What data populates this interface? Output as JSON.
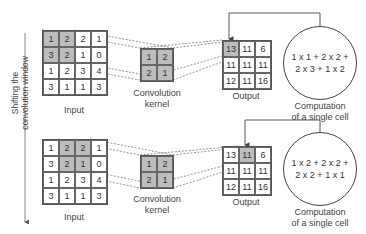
{
  "side_label": {
    "line1": "Shifting the",
    "line2": "convolution window"
  },
  "colors": {
    "shaded": "#bdbdbd",
    "line": "#444444",
    "dashed": "#666666"
  },
  "panels": [
    {
      "input": {
        "label": "Input",
        "cells": [
          [
            1,
            2,
            2,
            1
          ],
          [
            3,
            2,
            1,
            0
          ],
          [
            1,
            2,
            3,
            4
          ],
          [
            3,
            1,
            1,
            3
          ]
        ],
        "shaded": [
          [
            0,
            0
          ],
          [
            0,
            1
          ],
          [
            1,
            0
          ],
          [
            1,
            1
          ]
        ]
      },
      "kernel": {
        "label_line1": "Convolution",
        "label_line2": "kernel",
        "cells": [
          [
            1,
            2
          ],
          [
            2,
            1
          ]
        ]
      },
      "output": {
        "label": "Output",
        "cells": [
          [
            13,
            11,
            6
          ],
          [
            11,
            11,
            11
          ],
          [
            12,
            11,
            16
          ]
        ],
        "shaded": [
          [
            0,
            0
          ]
        ]
      },
      "computation": {
        "line1": "1 x 1 + 2 x 2 +",
        "line2": "2 x 3 + 1 x 2",
        "label_line1": "Computation",
        "label_line2": "of a single cell"
      }
    },
    {
      "input": {
        "label": "Input",
        "cells": [
          [
            1,
            2,
            2,
            1
          ],
          [
            3,
            2,
            1,
            0
          ],
          [
            1,
            2,
            3,
            4
          ],
          [
            3,
            1,
            1,
            3
          ]
        ],
        "shaded": [
          [
            0,
            1
          ],
          [
            0,
            2
          ],
          [
            1,
            1
          ],
          [
            1,
            2
          ]
        ]
      },
      "kernel": {
        "label_line1": "Convolution",
        "label_line2": "kernel",
        "cells": [
          [
            1,
            2
          ],
          [
            2,
            1
          ]
        ]
      },
      "output": {
        "label": "Output",
        "cells": [
          [
            13,
            11,
            6
          ],
          [
            11,
            11,
            11
          ],
          [
            12,
            11,
            16
          ]
        ],
        "shaded": [
          [
            0,
            1
          ]
        ]
      },
      "computation": {
        "line1": "1 x 2 + 2 x 2 +",
        "line2": "2 x 2 + 1 x 1",
        "label_line1": "Computation",
        "label_line2": "of a single cell"
      }
    }
  ]
}
